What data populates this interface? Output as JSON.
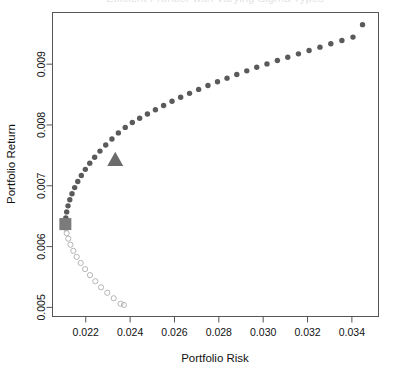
{
  "chart_data": {
    "type": "scatter",
    "title": "Efficient Frontier with Varying Sigma Types",
    "xlabel": "Portfolio Risk",
    "ylabel": "Portfolio Return",
    "xlim": [
      0.0205,
      0.0352
    ],
    "ylim": [
      0.00485,
      0.00985
    ],
    "xticks": [
      0.022,
      0.024,
      0.026,
      0.028,
      0.03,
      0.032,
      0.034
    ],
    "xticklabels": [
      "0.022",
      "0.024",
      "0.026",
      "0.028",
      "0.030",
      "0.032",
      "0.034"
    ],
    "yticks": [
      0.005,
      0.006,
      0.007,
      0.008,
      0.009
    ],
    "yticklabels": [
      "0.005",
      "0.006",
      "0.007",
      "0.008",
      "0.009"
    ],
    "grid": false,
    "legend": "none",
    "colors": {
      "efficient_points": "#5a5a5a",
      "inefficient_points": "#b6b6b6",
      "min_variance_marker": "#7b7b7b",
      "tangency_marker": "#6b6b6b",
      "axis": "#555555"
    },
    "series": [
      {
        "name": "Efficient frontier (filled circles)",
        "marker": "filled-circle",
        "color": "#5a5a5a",
        "x": [
          0.02108,
          0.0211,
          0.02114,
          0.0212,
          0.02128,
          0.02138,
          0.0215,
          0.02164,
          0.0218,
          0.02198,
          0.02218,
          0.0224,
          0.02264,
          0.0229,
          0.02318,
          0.02347,
          0.02378,
          0.0241,
          0.02443,
          0.02478,
          0.02514,
          0.02551,
          0.02589,
          0.02628,
          0.02668,
          0.02709,
          0.02751,
          0.02794,
          0.02837,
          0.02881,
          0.02926,
          0.02971,
          0.03017,
          0.03064,
          0.03111,
          0.03159,
          0.03207,
          0.03256,
          0.03305,
          0.03355,
          0.03405,
          0.03448
        ],
        "y": [
          0.00637,
          0.00647,
          0.00657,
          0.00667,
          0.00677,
          0.00687,
          0.00697,
          0.00707,
          0.00717,
          0.00727,
          0.00737,
          0.00747,
          0.00757,
          0.00767,
          0.00777,
          0.00787,
          0.00796,
          0.00804,
          0.00811,
          0.00818,
          0.00825,
          0.00832,
          0.00839,
          0.008455,
          0.00852,
          0.008585,
          0.00865,
          0.00871,
          0.00877,
          0.00883,
          0.00889,
          0.00895,
          0.009005,
          0.00906,
          0.009115,
          0.00917,
          0.009225,
          0.00928,
          0.009335,
          0.00939,
          0.009445,
          0.00965
        ]
      },
      {
        "name": "Inefficient frontier (open circles)",
        "marker": "open-circle",
        "color": "#b6b6b6",
        "x": [
          0.0211,
          0.02114,
          0.02121,
          0.02131,
          0.02144,
          0.02159,
          0.02177,
          0.02197,
          0.02219,
          0.02243,
          0.02269,
          0.02297,
          0.02326,
          0.02357,
          0.02372
        ],
        "y": [
          0.0063,
          0.00622,
          0.00613,
          0.00603,
          0.00593,
          0.00583,
          0.00573,
          0.00563,
          0.00553,
          0.00543,
          0.00533,
          0.00524,
          0.00515,
          0.00506,
          0.00504
        ]
      }
    ],
    "annotations": [
      {
        "name": "min-variance-portfolio",
        "marker": "square",
        "color": "#7b7b7b",
        "x": 0.02108,
        "y": 0.00637
      },
      {
        "name": "tangency-portfolio",
        "marker": "triangle-up",
        "color": "#6b6b6b",
        "x": 0.02333,
        "y": 0.00743
      }
    ]
  },
  "axes": {
    "x_title": "Portfolio Risk",
    "y_title": "Portfolio Return"
  },
  "title": {
    "text": "Efficient Frontier with Varying Sigma Types",
    "visible": false
  }
}
